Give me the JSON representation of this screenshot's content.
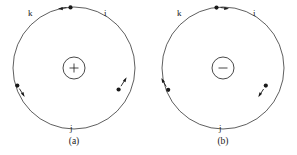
{
  "page": {
    "background_color": "#ffffff",
    "ink_color": "#1a1a1a",
    "width": 297,
    "height": 155
  },
  "figures": [
    {
      "id": "figure-a",
      "caption": "(a)",
      "nucleus": {
        "sign": "+",
        "charge_label": "positive",
        "cx": 74,
        "cy": 68,
        "r": 11
      },
      "orbit": {
        "cx": 74,
        "cy": 68,
        "r": 61,
        "stroke_color": "#1a1a1a"
      },
      "rotation_sense": "counterclockwise",
      "particles": [
        {
          "label": "i",
          "angle_deg": 285,
          "dot_x": 119,
          "dot_y": 88,
          "arrow_direction": "up-right"
        },
        {
          "label": "j",
          "angle_deg": 90,
          "dot_x": 74,
          "dot_y": 129,
          "arrow_direction": "none"
        },
        {
          "label": "k",
          "angle_deg": 200,
          "dot_x": 17,
          "dot_y": 86,
          "arrow_direction": "down-right"
        },
        {
          "label": "top",
          "angle_deg": 275,
          "dot_x": 70,
          "dot_y": 8,
          "arrow_direction": "left"
        }
      ],
      "labels": {
        "k": "k",
        "i": "i",
        "j": "j"
      }
    },
    {
      "id": "figure-b",
      "caption": "(b)",
      "nucleus": {
        "sign": "−",
        "charge_label": "negative",
        "cx": 74,
        "cy": 68,
        "r": 11
      },
      "orbit": {
        "cx": 74,
        "cy": 68,
        "r": 61,
        "stroke_color": "#1a1a1a"
      },
      "rotation_sense": "clockwise",
      "particles": [
        {
          "label": "i",
          "angle_deg": 285,
          "dot_x": 116,
          "dot_y": 85,
          "arrow_direction": "down-left"
        },
        {
          "label": "j",
          "angle_deg": 90,
          "dot_x": 74,
          "dot_y": 129,
          "arrow_direction": "none"
        },
        {
          "label": "k",
          "angle_deg": 200,
          "dot_x": 19,
          "dot_y": 89,
          "arrow_direction": "up-left"
        },
        {
          "label": "top",
          "angle_deg": 275,
          "dot_x": 68,
          "dot_y": 8,
          "arrow_direction": "right"
        }
      ],
      "labels": {
        "k": "k",
        "i": "i",
        "j": "j"
      }
    }
  ]
}
